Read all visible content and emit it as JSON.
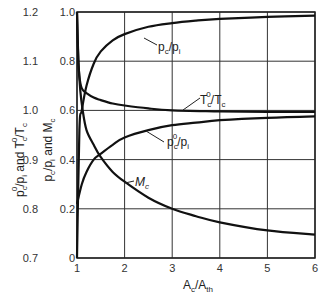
{
  "chart_data": {
    "type": "line",
    "title": "",
    "xlabel": "A_c/A_th",
    "xlabel_main": "A",
    "xlabel_sub1": "c",
    "xlabel_slash": "/A",
    "xlabel_sub2": "th",
    "xlim": [
      1,
      6
    ],
    "x_ticks": [
      "1",
      "2",
      "3",
      "4",
      "5",
      "6"
    ],
    "ylabel_inner": "p_c/p_i and M_c",
    "ylabel_outer": "p_c^0/p_i and T_c^0/T_c",
    "ylim_inner": [
      0,
      1.0
    ],
    "ylim_outer": [
      0.7,
      1.2
    ],
    "y_ticks_inner": [
      "0",
      "0.2",
      "0.4",
      "0.6",
      "0.8",
      "1.0"
    ],
    "y_ticks_outer": [
      "0.7",
      "0.8",
      "0.9",
      "1.0",
      "1.1",
      "1.2"
    ],
    "grid": true,
    "series": [
      {
        "name": "p_c/p_i",
        "axis": "inner",
        "x": [
          1.0,
          1.05,
          1.1,
          1.2,
          1.35,
          1.5,
          1.75,
          2.0,
          2.5,
          3.0,
          3.5,
          4.0,
          5.0,
          6.0
        ],
        "values": [
          0.0,
          0.52,
          0.6,
          0.7,
          0.79,
          0.84,
          0.885,
          0.91,
          0.94,
          0.955,
          0.965,
          0.972,
          0.98,
          0.985
        ]
      },
      {
        "name": "T_c^0/T_c",
        "axis": "outer",
        "x": [
          1.0,
          1.02,
          1.05,
          1.1,
          1.2,
          1.35,
          1.5,
          1.75,
          2.0,
          2.5,
          3.0,
          4.0,
          5.0,
          6.0
        ],
        "values": [
          1.2,
          1.12,
          1.07,
          1.045,
          1.035,
          1.026,
          1.021,
          1.014,
          1.01,
          1.004,
          1.0,
          0.998,
          0.997,
          0.997
        ]
      },
      {
        "name": "p_c^0/p_i",
        "axis": "outer",
        "x": [
          1.0,
          1.1,
          1.2,
          1.35,
          1.5,
          1.75,
          2.0,
          2.5,
          3.0,
          3.5,
          4.0,
          5.0,
          6.0
        ],
        "values": [
          0.81,
          0.85,
          0.875,
          0.9,
          0.912,
          0.93,
          0.945,
          0.96,
          0.97,
          0.975,
          0.98,
          0.985,
          0.988
        ]
      },
      {
        "name": "M_c",
        "axis": "inner",
        "x": [
          1.0,
          1.03,
          1.07,
          1.12,
          1.2,
          1.35,
          1.5,
          1.75,
          2.0,
          2.5,
          3.0,
          3.5,
          4.0,
          5.0,
          6.0
        ],
        "values": [
          1.0,
          0.8,
          0.68,
          0.6,
          0.52,
          0.46,
          0.41,
          0.35,
          0.31,
          0.245,
          0.2,
          0.17,
          0.145,
          0.112,
          0.095
        ]
      }
    ],
    "annotations": [
      {
        "text": "p_c/p_i",
        "main": "p",
        "sub": "c",
        "rest": "/p",
        "sub2": "i"
      },
      {
        "text": "T_c^0/T_c"
      },
      {
        "text": "p_c^0/p_i"
      },
      {
        "text": "M_c"
      }
    ]
  }
}
